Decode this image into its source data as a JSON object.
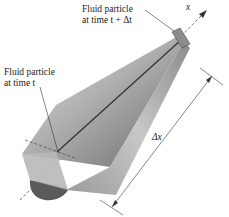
{
  "figure": {
    "axis_label": "x",
    "label_top_line1": "Fluid particle",
    "label_top_line2": "at time t + Δt",
    "label_left_line1": "Fluid particle",
    "label_left_line2": "at time t",
    "dimension_label": "Δx"
  },
  "colors": {
    "cone_light": "#d6d6d6",
    "cone_mid": "#a8a8a8",
    "cone_dark": "#6e6e6e",
    "end_cap": "#5a5a5a",
    "line": "#333333",
    "text": "#222222"
  }
}
